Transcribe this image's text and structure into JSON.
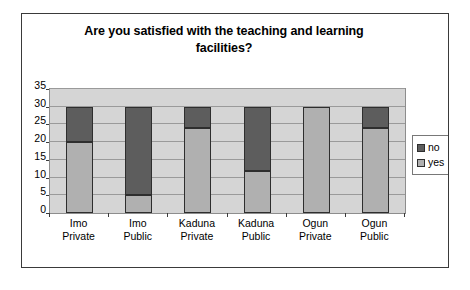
{
  "chart_data": {
    "type": "bar",
    "subtype": "stacked-column",
    "title": "Are you satisfied with the teaching and learning facilities?",
    "title_lines": [
      "Are you satisfied with the teaching and learning",
      "facilities?"
    ],
    "xlabel": "",
    "ylabel": "",
    "ylim": [
      0,
      35
    ],
    "yticks": [
      0,
      5,
      10,
      15,
      20,
      25,
      30,
      35
    ],
    "ytick_labels": [
      "0",
      "5",
      "10",
      "15",
      "20",
      "25",
      "30",
      "35"
    ],
    "grid": true,
    "legend_position": "right",
    "categories": [
      "Imo Private",
      "Imo Public",
      "Kaduna Private",
      "Kaduna Public",
      "Ogun Private",
      "Ogun Public"
    ],
    "category_lines": [
      [
        "Imo",
        "Private"
      ],
      [
        "Imo",
        "Public"
      ],
      [
        "Kaduna",
        "Private"
      ],
      [
        "Kaduna",
        "Public"
      ],
      [
        "Ogun",
        "Private"
      ],
      [
        "Ogun",
        "Public"
      ]
    ],
    "series": [
      {
        "name": "yes",
        "color": "#b0b0b0",
        "values": [
          20,
          5,
          24,
          12,
          30,
          24
        ]
      },
      {
        "name": "no",
        "color": "#5d5d5d",
        "values": [
          10,
          25,
          6,
          18,
          0,
          6
        ]
      }
    ],
    "totals": [
      30,
      30,
      30,
      30,
      30,
      30
    ],
    "legend": [
      {
        "label": "no",
        "color": "#5d5d5d"
      },
      {
        "label": "yes",
        "color": "#b0b0b0"
      }
    ],
    "plot_background": "#d5d5d5",
    "figure_background": "#ffffff"
  }
}
